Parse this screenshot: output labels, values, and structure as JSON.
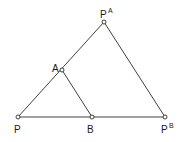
{
  "diagram": {
    "points": [
      {
        "id": "P",
        "label": "P",
        "sup": "",
        "x": 18,
        "y": 117
      },
      {
        "id": "B",
        "label": "B",
        "sup": "",
        "x": 92,
        "y": 117
      },
      {
        "id": "PB",
        "label": "P",
        "sup": "B",
        "x": 165,
        "y": 117
      },
      {
        "id": "A",
        "label": "A",
        "sup": "",
        "x": 62,
        "y": 70
      },
      {
        "id": "PA",
        "label": "P",
        "sup": "A",
        "x": 104,
        "y": 22
      }
    ],
    "edges": [
      [
        "P",
        "PB"
      ],
      [
        "P",
        "PA"
      ],
      [
        "PA",
        "PB"
      ],
      [
        "A",
        "B"
      ]
    ],
    "labels": {
      "P": "P",
      "B": "B",
      "PB_base": "P",
      "PB_sup": "B",
      "A": "A",
      "PA_base": "P",
      "PA_sup": "A"
    },
    "colors": {
      "stroke": "#2a2a2a",
      "text": "#1a1a1a",
      "background": "#ffffff"
    }
  }
}
